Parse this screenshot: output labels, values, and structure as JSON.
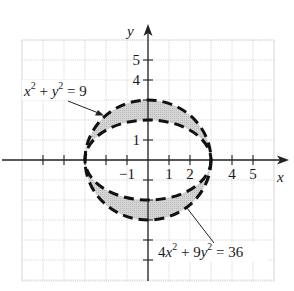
{
  "chart_data": {
    "type": "region",
    "title": "",
    "xlabel": "x",
    "ylabel": "y",
    "xlim": [
      -6,
      6
    ],
    "ylim": [
      -6,
      6
    ],
    "grid": true,
    "x_ticks": [
      -5,
      -4,
      -3,
      -2,
      -1,
      1,
      2,
      3,
      4,
      5
    ],
    "x_tick_labels": [
      {
        "value": -1,
        "label": "−1"
      },
      {
        "value": 1,
        "label": "1"
      },
      {
        "value": 2,
        "label": "2"
      },
      {
        "value": 4,
        "label": "4"
      },
      {
        "value": 5,
        "label": "5"
      }
    ],
    "y_ticks": [
      -5,
      -4,
      -3,
      -2,
      -1,
      1,
      2,
      3,
      4,
      5
    ],
    "y_tick_labels": [
      {
        "value": 1,
        "label": "1"
      },
      {
        "value": 4,
        "label": "4"
      },
      {
        "value": 5,
        "label": "5"
      }
    ],
    "curves": [
      {
        "name": "circle",
        "equation": "x^2 + y^2 = 9",
        "label": "x² + y² = 9",
        "kind": "circle",
        "center": [
          0,
          0
        ],
        "radius": 3,
        "style": "dashed"
      },
      {
        "name": "ellipse",
        "equation": "4x^2 + 9y^2 = 36",
        "label": "4x² + 9y² = 36",
        "kind": "ellipse",
        "center": [
          0,
          0
        ],
        "semi_x": 3,
        "semi_y": 2,
        "style": "dashed"
      }
    ],
    "shaded_region": "between ellipse 4x^2+9y^2=36 and circle x^2+y^2=9 (4x^2+9y^2>36 and x^2+y^2<9)",
    "shade_color": "#cfcfcf"
  },
  "labels": {
    "x_axis": "x",
    "y_axis": "y",
    "circle": {
      "base1": "x",
      "exp1": "2",
      "plus": " + ",
      "base2": "y",
      "exp2": "2",
      "rhs": " = 9"
    },
    "ellipse": {
      "coef1": "4",
      "base1": "x",
      "exp1": "2",
      "plus": " + 9",
      "base2": "y",
      "exp2": "2",
      "rhs": " = 36"
    }
  },
  "colors": {
    "curve": "#111111",
    "grid": "#c8c8c8",
    "axis": "#222222",
    "shade": "#cfcfcf"
  }
}
